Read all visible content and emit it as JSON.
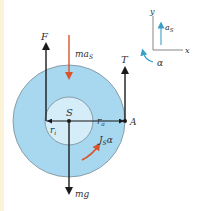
{
  "diagram": {
    "type": "free-body diagram",
    "body": {
      "center_label": "S",
      "point_label": "A",
      "inner_radius_label": "r_i",
      "outer_radius_label": "r_a"
    },
    "forces": [
      {
        "label": "F",
        "direction": "up",
        "color": "#1a1a1a"
      },
      {
        "label": "ma_S",
        "main": "ma",
        "sub": "S",
        "direction": "down",
        "color": "#d9532b"
      },
      {
        "label": "T",
        "direction": "up",
        "color": "#1a1a1a"
      },
      {
        "label": "mg",
        "direction": "down",
        "color": "#1a1a1a"
      },
      {
        "label": "J_S α",
        "main": "J",
        "sub": "S",
        "suffix": "α",
        "direction": "clockwise-arc",
        "color": "#d9532b"
      }
    ],
    "axes": {
      "x_label": "x",
      "y_label": "y",
      "accel_main": "a",
      "accel_sub": "S",
      "angular_label": "α",
      "color": "#3aa0c8"
    },
    "colors": {
      "disk_outer": "#a8d8ef",
      "disk_inner": "#d4edf8",
      "outline": "#7a8a96",
      "accent": "#d9532b",
      "axis_accent": "#3aa0c8"
    }
  }
}
